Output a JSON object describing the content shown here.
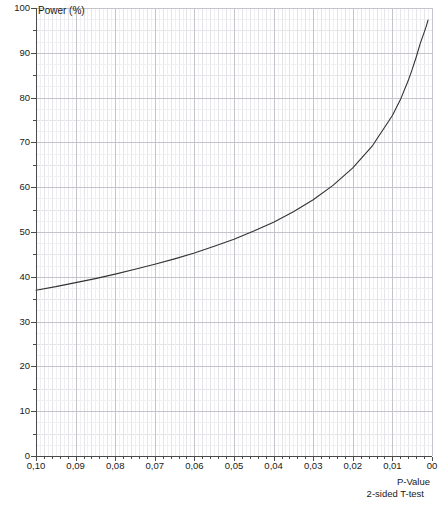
{
  "chart_data": {
    "type": "line",
    "title": "",
    "xlabel": "P-Value",
    "sublabel": "2-sided T-test",
    "ylabel": "Power (%)",
    "xlim": [
      0.1,
      0.0
    ],
    "ylim": [
      0,
      100
    ],
    "x_reversed": true,
    "grid": true,
    "legend": "none",
    "x_tick_labels": [
      "0,10",
      "0,09",
      "0,08",
      "0,07",
      "0,06",
      "0,05",
      "0,04",
      "0,03",
      "0,02",
      "0,01",
      "00"
    ],
    "x_tick_values": [
      0.1,
      0.09,
      0.08,
      0.07,
      0.06,
      0.05,
      0.04,
      0.03,
      0.02,
      0.01,
      0.0
    ],
    "y_tick_labels": [
      "0",
      "10",
      "20",
      "30",
      "40",
      "50",
      "60",
      "70",
      "80",
      "90",
      "100"
    ],
    "y_tick_values": [
      0,
      10,
      20,
      30,
      40,
      50,
      60,
      70,
      80,
      90,
      100
    ],
    "y_minor_step": 5,
    "x_minor_subdivisions": 5,
    "series": [
      {
        "name": "Power curve",
        "color": "#333333",
        "x": [
          0.1,
          0.095,
          0.09,
          0.085,
          0.08,
          0.075,
          0.07,
          0.065,
          0.06,
          0.055,
          0.05,
          0.045,
          0.04,
          0.035,
          0.03,
          0.025,
          0.02,
          0.015,
          0.01,
          0.008,
          0.006,
          0.005,
          0.004,
          0.003,
          0.002,
          0.0015,
          0.001
        ],
        "y": [
          37.0,
          37.8,
          38.7,
          39.6,
          40.6,
          41.7,
          42.8,
          44.0,
          45.3,
          46.8,
          48.4,
          50.2,
          52.2,
          54.5,
          57.2,
          60.4,
          64.3,
          69.3,
          76.0,
          79.5,
          83.8,
          86.3,
          89.0,
          92.0,
          94.5,
          95.8,
          97.3
        ]
      }
    ]
  },
  "axis": {
    "y_title": "Power (%)",
    "x_title": "P-Value",
    "x_subtitle": "2-sided T-test"
  }
}
